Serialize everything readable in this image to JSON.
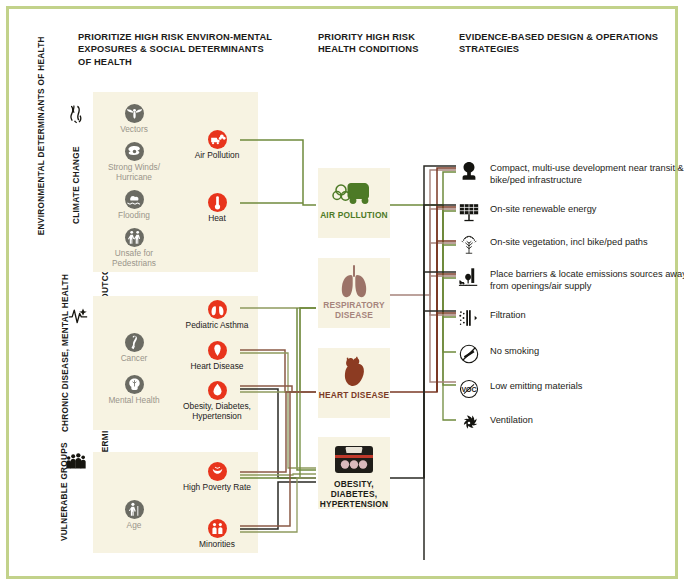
{
  "colors": {
    "frame": "#c2d28a",
    "cream": "#f7f3e2",
    "red_badge": "#e8341c",
    "grey_badge": "#6b6b63",
    "air_pollution": "#4d7a26",
    "respiratory": "#a6847c",
    "heart": "#7b3a26",
    "obesity": "#1d1c17",
    "wire_green": "#6f8a3c",
    "wire_olive": "#8e9a5e",
    "wire_brown": "#8a5a46",
    "wire_dark": "#2a2a24",
    "wire_mauve": "#a6847c"
  },
  "headers": {
    "exposures": "PRIORITIZE HIGH RISK ENVIRON-MENTAL EXPOSURES & SOCIAL DETERMINANTS OF HEALTH",
    "conditions": "PRIORITY HIGH RISK HEALTH CONDITIONS",
    "strategies": "EVIDENCE-BASED DESIGN & OPERATIONS STRATEGIES"
  },
  "side_labels": {
    "environmental": "ENVIRONMENTAL DETERMINANTS OF HEALTH",
    "social": "SOCIAL DETERMINANTS OF HEALTH & HEALTH OUTCOMES"
  },
  "groups": [
    {
      "key": "climate",
      "label": "CLIMATE CHANGE",
      "icon": "tornado-icon",
      "exposures": [
        {
          "label": "Vectors",
          "icon": "mosquito-icon"
        },
        {
          "label": "Strong Winds/ Hurricane",
          "icon": "hurricane-icon"
        },
        {
          "label": "Flooding",
          "icon": "flood-icon"
        },
        {
          "label": "Unsafe for Pedestrians",
          "icon": "pedestrian-icon"
        }
      ],
      "risks": [
        {
          "label": "Air Pollution",
          "icon": "air-pollution-icon"
        },
        {
          "label": "Heat",
          "icon": "thermometer-icon"
        }
      ]
    },
    {
      "key": "chronic",
      "label": "CHRONIC DISEASE, MENTAL HEALTH",
      "icon": "heartbeat-icon",
      "exposures": [
        {
          "label": "Cancer",
          "icon": "ribbon-icon"
        },
        {
          "label": "Mental Health",
          "icon": "brain-icon"
        }
      ],
      "risks": [
        {
          "label": "Pediatric Asthma",
          "icon": "lungs-icon"
        },
        {
          "label": "Heart Disease",
          "icon": "heart-icon"
        },
        {
          "label": "Obesity, Diabetes, Hypertension",
          "icon": "drop-icon"
        }
      ]
    },
    {
      "key": "vulnerable",
      "label": "VULNERABLE GROUPS",
      "icon": "people-icon",
      "exposures": [
        {
          "label": "Age",
          "icon": "elderly-icon"
        }
      ],
      "risks": [
        {
          "label": "High Poverty Rate",
          "icon": "poverty-icon"
        },
        {
          "label": "Minorities",
          "icon": "minorities-icon"
        }
      ]
    }
  ],
  "conditions": [
    {
      "key": "air",
      "label": "AIR POLLUTION",
      "icon": "smog-cloud-icon",
      "color": "#4d7a26"
    },
    {
      "key": "resp",
      "label": "RESPIRATORY DISEASE",
      "icon": "lungs-icon",
      "color": "#a6847c"
    },
    {
      "key": "hrt",
      "label": "HEART DISEASE",
      "icon": "anatomical-heart-icon",
      "color": "#7b3a26"
    },
    {
      "key": "obes",
      "label": "OBESITY, DIABETES, HYPERTENSION",
      "icon": "scale-icon",
      "color": "#1d1c17"
    }
  ],
  "strategies": [
    {
      "icon": "tree-silhouette-icon",
      "text": "Compact, multi-use development near transit & bike/ped infrastructure"
    },
    {
      "icon": "solar-panel-icon",
      "text": "On-site renewable energy"
    },
    {
      "icon": "vegetation-tree-icon",
      "text": "On-site vegetation, incl bike/ped paths"
    },
    {
      "icon": "barrier-icon",
      "text": "Place barriers & locate emissions sources away from openings/air supply"
    },
    {
      "icon": "filtration-icon",
      "text": "Filtration"
    },
    {
      "icon": "no-smoking-icon",
      "text": "No smoking"
    },
    {
      "icon": "voc-icon",
      "text": "Low emitting materials"
    },
    {
      "icon": "ventilation-fan-icon",
      "text": "Ventilation"
    }
  ]
}
